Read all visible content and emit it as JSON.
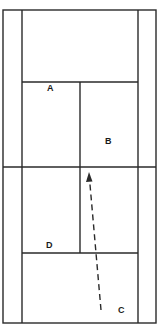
{
  "diagram": {
    "type": "tennis-court",
    "colors": {
      "line": "#2a2a2a",
      "background": "#ffffff",
      "label": "#1a1a1a"
    },
    "labels": [
      {
        "id": "A",
        "text": "A",
        "x": 47,
        "y": 91
      },
      {
        "id": "B",
        "text": "B",
        "x": 108,
        "y": 144
      },
      {
        "id": "D",
        "text": "D",
        "x": 50,
        "y": 248
      },
      {
        "id": "C",
        "text": "C",
        "x": 121,
        "y": 313
      }
    ],
    "arrow": {
      "from": [
        101,
        310
      ],
      "to": [
        89,
        173
      ],
      "style": "dashed"
    }
  }
}
